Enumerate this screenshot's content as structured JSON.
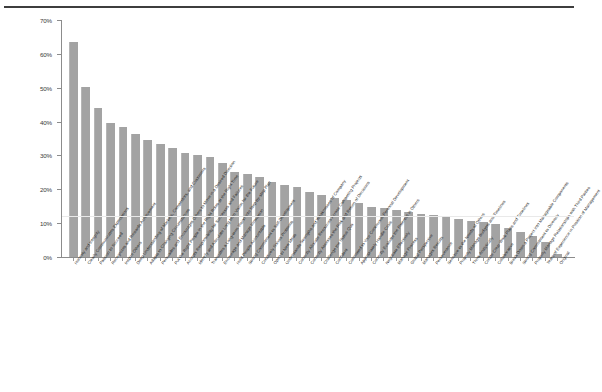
{
  "chart_data": {
    "type": "bar",
    "title": "",
    "subtitle": "",
    "xlabel": "",
    "ylabel": "",
    "ylim": [
      0,
      70
    ],
    "y_tick_labels": [
      "0%",
      "10%",
      "20%",
      "30%",
      "40%",
      "50%",
      "60%",
      "70%"
    ],
    "y_tick_values": [
      0,
      10,
      20,
      30,
      40,
      50,
      60,
      70
    ],
    "grid": false,
    "legend": "none",
    "bar_color": "#a3a3a3",
    "background_color": "#ffffff",
    "axis_color": "#8c8c8c",
    "categories": [
      "Honesty and Integrity",
      "Clearly Communicates Expectations",
      "Passion to Succeed",
      "Recognizes and Rewards Achievement",
      "Inspire Others",
      "Deep Understanding of Markets, Competitors, and Customers",
      "Adapts to Changing Circumstances",
      "Persuades and Encourages Others to Move in a Desired Direction",
      "Put the Right People in the Right Roles at the Right Time",
      "Accepts Responsibility for Successes and Failures",
      "Identify and Articulate Long-term Vision for the Future",
      "Translates a Long-term Vision into Step-by-step Plan",
      "Encourage and Manage Innovation",
      "Hold People Accountable",
      "Strong Commitment to Self-Development",
      "Creatively Solves Problems",
      "Open to New Ideas",
      "Understands Strengths and Weaknesses of Company",
      "Correctly Allocate Resources Across Competing Projects",
      "Correctly Assesses the Risk and Return of Decisions",
      "Challenge the Status Quo",
      "Confident",
      "Committed to Your Continuous Personal Development",
      "Appropriately Handle Crisis",
      "Correctly Evaluate the Potential in Others",
      "Negotiate Effectively",
      "Manage Process",
      "Global Perspective",
      "Manages Results",
      "Perseverance",
      "Sensitive to the Needs of Others",
      "Properly Manage Budgets and Timelines",
      "Think Analytically",
      "Create Clear Work Plans and Timelines",
      "Collaborative",
      "Break Down a Project into Manageable Components",
      "Strong Commitment to Diversity",
      "Properly Manage Relationships with Third Parties",
      "Years of Experience in Position of Management",
      "Original"
    ],
    "values": [
      63.5,
      50.3,
      44.1,
      39.5,
      38.4,
      36.4,
      34.6,
      33.4,
      32.2,
      30.8,
      30.2,
      29.4,
      27.8,
      25.0,
      24.6,
      23.6,
      22.2,
      21.3,
      20.6,
      19.1,
      18.2,
      17.3,
      16.9,
      16.0,
      14.9,
      14.5,
      13.9,
      13.3,
      12.8,
      12.4,
      11.9,
      11.1,
      10.6,
      10.2,
      9.7,
      8.5,
      7.3,
      6.3,
      4.3,
      1.0
    ]
  }
}
